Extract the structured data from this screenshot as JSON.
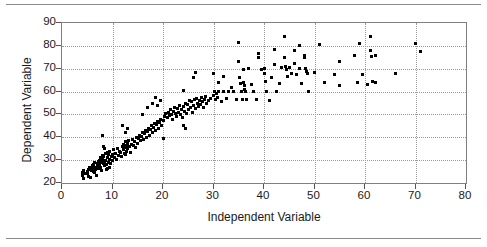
{
  "figure": {
    "background": "#ffffff",
    "marker_color": "#000000",
    "grid_color": "#9a9a9a",
    "axis_color": "#808080",
    "rules": {
      "top": true,
      "bottom": true
    }
  },
  "chart_data": {
    "type": "scatter",
    "title": "",
    "xlabel": "Independent Variable",
    "ylabel": "Dependent Variable",
    "xlim": [
      0,
      80
    ],
    "ylim": [
      20,
      90
    ],
    "xticks": [
      0,
      10,
      20,
      30,
      40,
      50,
      60,
      70,
      80
    ],
    "yticks": [
      20,
      30,
      40,
      50,
      60,
      70,
      80,
      90
    ],
    "grid": true,
    "legend": "none",
    "marker": "square",
    "marker_size_px": 3,
    "series": [
      {
        "name": "observations",
        "points": [
          [
            4.0,
            23.5
          ],
          [
            4.1,
            24.5
          ],
          [
            4.2,
            22.0
          ],
          [
            4.3,
            25.5
          ],
          [
            4.4,
            24.0
          ],
          [
            5.0,
            24.0
          ],
          [
            5.1,
            25.0
          ],
          [
            5.2,
            26.0
          ],
          [
            5.3,
            23.0
          ],
          [
            5.4,
            27.0
          ],
          [
            5.6,
            22.5
          ],
          [
            5.8,
            25.5
          ],
          [
            6.0,
            26.5
          ],
          [
            6.1,
            27.5
          ],
          [
            6.2,
            25.0
          ],
          [
            6.3,
            28.0
          ],
          [
            6.4,
            24.5
          ],
          [
            6.5,
            29.0
          ],
          [
            6.6,
            26.0
          ],
          [
            6.7,
            27.0
          ],
          [
            6.8,
            23.5
          ],
          [
            7.0,
            28.5
          ],
          [
            7.1,
            27.5
          ],
          [
            7.2,
            29.5
          ],
          [
            7.3,
            26.5
          ],
          [
            7.4,
            30.0
          ],
          [
            7.5,
            28.0
          ],
          [
            7.6,
            31.0
          ],
          [
            7.7,
            27.0
          ],
          [
            7.8,
            29.0
          ],
          [
            7.9,
            25.5
          ],
          [
            8.0,
            30.5
          ],
          [
            8.1,
            32.0
          ],
          [
            8.2,
            28.5
          ],
          [
            8.3,
            31.5
          ],
          [
            8.4,
            29.5
          ],
          [
            8.5,
            27.5
          ],
          [
            8.6,
            33.0
          ],
          [
            8.7,
            30.0
          ],
          [
            8.8,
            28.0
          ],
          [
            8.9,
            26.0
          ],
          [
            9.0,
            31.0
          ],
          [
            9.1,
            33.5
          ],
          [
            9.2,
            29.0
          ],
          [
            9.3,
            32.5
          ],
          [
            9.4,
            30.5
          ],
          [
            9.5,
            34.0
          ],
          [
            9.6,
            28.5
          ],
          [
            9.8,
            31.5
          ],
          [
            10.0,
            30.0
          ],
          [
            8.0,
            41.0
          ],
          [
            8.2,
            36.0
          ],
          [
            8.5,
            35.0
          ],
          [
            9.0,
            26.5
          ],
          [
            9.5,
            27.0
          ],
          [
            10.0,
            32.5
          ],
          [
            10.2,
            34.5
          ],
          [
            10.4,
            31.0
          ],
          [
            10.6,
            33.0
          ],
          [
            10.8,
            30.5
          ],
          [
            11.0,
            35.0
          ],
          [
            11.2,
            32.0
          ],
          [
            11.4,
            34.0
          ],
          [
            11.6,
            33.5
          ],
          [
            11.8,
            31.5
          ],
          [
            12.0,
            36.0
          ],
          [
            12.1,
            34.5
          ],
          [
            12.2,
            37.0
          ],
          [
            12.3,
            33.0
          ],
          [
            12.4,
            35.5
          ],
          [
            12.5,
            38.0
          ],
          [
            12.6,
            32.5
          ],
          [
            12.7,
            36.5
          ],
          [
            12.8,
            34.0
          ],
          [
            12.9,
            37.5
          ],
          [
            13.0,
            35.0
          ],
          [
            13.2,
            38.5
          ],
          [
            13.4,
            36.0
          ],
          [
            13.6,
            33.5
          ],
          [
            13.8,
            37.0
          ],
          [
            14.0,
            39.0
          ],
          [
            14.2,
            36.5
          ],
          [
            14.4,
            38.0
          ],
          [
            14.6,
            35.5
          ],
          [
            14.8,
            40.0
          ],
          [
            12.0,
            45.0
          ],
          [
            12.5,
            42.0
          ],
          [
            13.0,
            44.0
          ],
          [
            15.0,
            37.5
          ],
          [
            15.2,
            39.5
          ],
          [
            15.4,
            41.0
          ],
          [
            15.6,
            38.5
          ],
          [
            15.8,
            40.5
          ],
          [
            16.0,
            42.0
          ],
          [
            16.2,
            39.0
          ],
          [
            16.4,
            41.5
          ],
          [
            16.6,
            43.0
          ],
          [
            16.8,
            40.0
          ],
          [
            17.0,
            42.5
          ],
          [
            17.2,
            44.0
          ],
          [
            17.4,
            41.0
          ],
          [
            17.6,
            43.5
          ],
          [
            17.8,
            45.0
          ],
          [
            18.0,
            42.0
          ],
          [
            18.2,
            44.5
          ],
          [
            18.4,
            46.0
          ],
          [
            18.6,
            43.0
          ],
          [
            18.8,
            45.5
          ],
          [
            19.0,
            47.0
          ],
          [
            19.2,
            44.0
          ],
          [
            19.4,
            46.5
          ],
          [
            19.6,
            48.0
          ],
          [
            19.8,
            45.0
          ],
          [
            20.0,
            47.5
          ],
          [
            20.2,
            49.0
          ],
          [
            16.0,
            50.0
          ],
          [
            17.0,
            53.0
          ],
          [
            18.0,
            55.0
          ],
          [
            18.5,
            57.5
          ],
          [
            19.0,
            54.0
          ],
          [
            19.5,
            56.0
          ],
          [
            20.0,
            39.5
          ],
          [
            20.5,
            50.5
          ],
          [
            20.8,
            48.5
          ],
          [
            21.0,
            51.0
          ],
          [
            21.2,
            49.5
          ],
          [
            21.4,
            52.0
          ],
          [
            21.6,
            50.0
          ],
          [
            21.8,
            48.0
          ],
          [
            22.0,
            51.5
          ],
          [
            22.2,
            53.0
          ],
          [
            22.4,
            50.5
          ],
          [
            22.6,
            49.0
          ],
          [
            22.8,
            52.5
          ],
          [
            23.0,
            51.0
          ],
          [
            23.2,
            54.0
          ],
          [
            23.4,
            50.0
          ],
          [
            23.6,
            52.0
          ],
          [
            23.8,
            48.5
          ],
          [
            24.0,
            53.5
          ],
          [
            24.2,
            51.5
          ],
          [
            24.4,
            55.0
          ],
          [
            24.6,
            50.5
          ],
          [
            24.8,
            54.5
          ],
          [
            25.0,
            52.0
          ],
          [
            24.0,
            45.0
          ],
          [
            24.5,
            44.0
          ],
          [
            25.2,
            56.0
          ],
          [
            25.4,
            53.0
          ],
          [
            25.6,
            55.5
          ],
          [
            25.8,
            51.0
          ],
          [
            26.0,
            54.0
          ],
          [
            26.2,
            56.5
          ],
          [
            26.4,
            52.5
          ],
          [
            26.6,
            57.0
          ],
          [
            26.8,
            55.0
          ],
          [
            27.0,
            53.5
          ],
          [
            27.2,
            56.0
          ],
          [
            27.4,
            54.5
          ],
          [
            27.6,
            57.5
          ],
          [
            27.8,
            55.5
          ],
          [
            28.0,
            53.0
          ],
          [
            28.2,
            56.5
          ],
          [
            28.4,
            58.0
          ],
          [
            28.6,
            55.0
          ],
          [
            26.0,
            66.0
          ],
          [
            26.5,
            68.5
          ],
          [
            24.0,
            60.5
          ],
          [
            29.0,
            56.0
          ],
          [
            29.5,
            57.0
          ],
          [
            30.0,
            58.5
          ],
          [
            30.2,
            60.0
          ],
          [
            30.4,
            56.5
          ],
          [
            30.6,
            59.0
          ],
          [
            30.8,
            57.5
          ],
          [
            31.0,
            60.0
          ],
          [
            31.5,
            55.5
          ],
          [
            32.0,
            60.0
          ],
          [
            32.5,
            57.0
          ],
          [
            33.0,
            60.0
          ],
          [
            30.0,
            68.0
          ],
          [
            31.0,
            64.0
          ],
          [
            32.0,
            66.5
          ],
          [
            33.5,
            62.0
          ],
          [
            34.0,
            60.0
          ],
          [
            34.5,
            56.5
          ],
          [
            35.0,
            81.5
          ],
          [
            35.0,
            73.0
          ],
          [
            35.2,
            66.0
          ],
          [
            35.4,
            63.5
          ],
          [
            35.6,
            60.0
          ],
          [
            35.8,
            56.5
          ],
          [
            36.0,
            69.5
          ],
          [
            36.0,
            64.0
          ],
          [
            36.1,
            62.5
          ],
          [
            36.2,
            61.0
          ],
          [
            36.3,
            60.0
          ],
          [
            36.5,
            56.5
          ],
          [
            37.0,
            70.0
          ],
          [
            37.5,
            63.0
          ],
          [
            38.0,
            60.0
          ],
          [
            38.5,
            56.5
          ],
          [
            39.0,
            76.5
          ],
          [
            39.0,
            75.0
          ],
          [
            39.5,
            69.5
          ],
          [
            40.0,
            70.0
          ],
          [
            40.0,
            68.0
          ],
          [
            40.2,
            64.5
          ],
          [
            40.5,
            60.0
          ],
          [
            41.0,
            56.0
          ],
          [
            41.5,
            66.0
          ],
          [
            42.0,
            78.5
          ],
          [
            42.0,
            72.0
          ],
          [
            42.5,
            60.0
          ],
          [
            43.0,
            63.5
          ],
          [
            43.5,
            70.5
          ],
          [
            44.0,
            84.0
          ],
          [
            44.0,
            75.0
          ],
          [
            44.2,
            71.0
          ],
          [
            44.4,
            69.5
          ],
          [
            44.6,
            66.5
          ],
          [
            45.0,
            70.5
          ],
          [
            45.5,
            68.0
          ],
          [
            46.0,
            78.0
          ],
          [
            46.0,
            72.5
          ],
          [
            46.5,
            67.5
          ],
          [
            47.0,
            80.0
          ],
          [
            47.0,
            70.0
          ],
          [
            47.5,
            63.5
          ],
          [
            48.0,
            76.0
          ],
          [
            48.0,
            75.0
          ],
          [
            48.2,
            70.0
          ],
          [
            48.4,
            69.0
          ],
          [
            48.6,
            68.0
          ],
          [
            48.8,
            60.0
          ],
          [
            50.0,
            68.5
          ],
          [
            51.0,
            80.5
          ],
          [
            52.0,
            64.0
          ],
          [
            54.0,
            67.5
          ],
          [
            55.0,
            73.0
          ],
          [
            55.0,
            62.5
          ],
          [
            58.0,
            76.0
          ],
          [
            58.5,
            64.0
          ],
          [
            59.0,
            81.0
          ],
          [
            59.5,
            67.5
          ],
          [
            60.5,
            63.0
          ],
          [
            61.0,
            84.0
          ],
          [
            61.0,
            78.0
          ],
          [
            61.2,
            75.5
          ],
          [
            61.5,
            64.5
          ],
          [
            62.0,
            76.0
          ],
          [
            62.0,
            64.0
          ],
          [
            66.0,
            68.0
          ],
          [
            70.0,
            81.0
          ],
          [
            71.0,
            77.5
          ]
        ]
      }
    ]
  }
}
